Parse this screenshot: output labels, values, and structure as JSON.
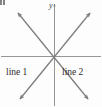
{
  "figure": {
    "type": "coordinate-plane-diagram",
    "background_color": "#fdfdfd",
    "stroke_color": "#808080",
    "text_color": "#2e2e2e",
    "origin": {
      "x": 54,
      "y": 56
    },
    "axes": {
      "x_axis": {
        "label": "",
        "x1": 1,
        "y1": 56,
        "x2": 101,
        "y2": 56,
        "arrow": "none"
      },
      "y_axis": {
        "label": "y",
        "x1": 54,
        "y1": 3,
        "x2": 54,
        "y2": 106,
        "arrow": "up"
      }
    },
    "lines": [
      {
        "name": "line 1",
        "label": "line 1",
        "label_position": {
          "x": 6,
          "y": 68
        },
        "direction": "up-right",
        "arrowheads": "both",
        "endpoints": {
          "x1": 20,
          "y1": 99,
          "x2": 90,
          "y2": 13
        }
      },
      {
        "name": "line 2",
        "label": "line 2",
        "label_position": {
          "x": 62,
          "y": 68
        },
        "direction": "down-right",
        "arrowheads": "both",
        "endpoints": {
          "x1": 18,
          "y1": 13,
          "x2": 88,
          "y2": 99
        }
      }
    ],
    "corner_mark": {
      "present": true,
      "position": "top-left"
    }
  }
}
